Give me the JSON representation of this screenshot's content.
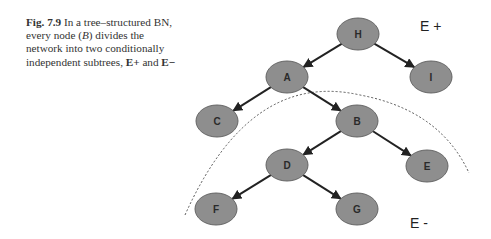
{
  "caption": {
    "fig_label": "Fig. 7.9",
    "text_1": "In a tree–structured BN, every node (",
    "node_ref": "B",
    "text_2": ") divides the network into two conditionally independent subtrees, ",
    "e_plus": "E+",
    "text_3": " and ",
    "e_minus": "E−"
  },
  "diagram": {
    "nodes": [
      {
        "id": "H",
        "label": "H",
        "cx": 358,
        "cy": 34
      },
      {
        "id": "A",
        "label": "A",
        "cx": 287,
        "cy": 77
      },
      {
        "id": "I",
        "label": "I",
        "cx": 431,
        "cy": 77
      },
      {
        "id": "C",
        "label": "C",
        "cx": 217,
        "cy": 121
      },
      {
        "id": "B",
        "label": "B",
        "cx": 357,
        "cy": 121
      },
      {
        "id": "D",
        "label": "D",
        "cx": 287,
        "cy": 165
      },
      {
        "id": "E",
        "label": "E",
        "cx": 427,
        "cy": 166
      },
      {
        "id": "F",
        "label": "F",
        "cx": 216,
        "cy": 209
      },
      {
        "id": "G",
        "label": "G",
        "cx": 357,
        "cy": 209
      }
    ],
    "edges": [
      [
        "H",
        "A"
      ],
      [
        "H",
        "I"
      ],
      [
        "A",
        "C"
      ],
      [
        "A",
        "B"
      ],
      [
        "B",
        "D"
      ],
      [
        "B",
        "E"
      ],
      [
        "D",
        "F"
      ],
      [
        "D",
        "G"
      ]
    ],
    "region_labels": {
      "e_plus": "E +",
      "e_minus": "E -"
    },
    "colors": {
      "node_fill": "#8e8e8e",
      "node_stroke": "#666666",
      "edge": "#222222",
      "arc": "#555555"
    }
  }
}
